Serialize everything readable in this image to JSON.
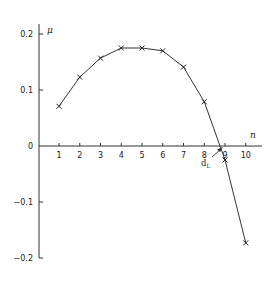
{
  "chart_data": {
    "type": "line",
    "title": "",
    "xlabel": "n",
    "ylabel": "μ",
    "x": [
      1,
      2,
      3,
      4,
      5,
      6,
      7,
      8,
      9,
      10
    ],
    "series": [
      {
        "name": "μ(n)",
        "marker": "x",
        "values": [
          0.071,
          0.123,
          0.157,
          0.175,
          0.175,
          0.17,
          0.141,
          0.079,
          -0.025,
          -0.173
        ]
      }
    ],
    "xticks": [
      "1",
      "2",
      "3",
      "4",
      "5",
      "6",
      "7",
      "8",
      "9",
      "10"
    ],
    "yticks": [
      "0.2",
      "0.1",
      "0",
      "-0.1",
      "-0.2"
    ],
    "ytick_values": [
      0.2,
      0.1,
      0,
      -0.1,
      -0.2
    ],
    "ylim": [
      -0.2,
      0.21
    ],
    "xlim": [
      0,
      10.7
    ],
    "grid": false,
    "legend": null,
    "annotations": [
      {
        "text": "d",
        "subscript": "L",
        "points_to_x": 8.75,
        "points_to_y": 0,
        "note": "zero-crossing marked by arrow"
      }
    ],
    "line_color": "#333333"
  }
}
